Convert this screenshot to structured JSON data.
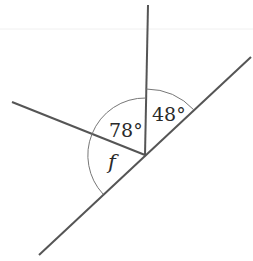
{
  "diagram": {
    "type": "angles-at-a-point-on-straight-line",
    "vertex": [
      145,
      155
    ],
    "rays": [
      {
        "name": "vertical-ray",
        "to": [
          148,
          5
        ]
      },
      {
        "name": "left-ray",
        "to": [
          12,
          102
        ]
      },
      {
        "name": "line-upper",
        "to": [
          251,
          57
        ]
      },
      {
        "name": "line-lower",
        "to": [
          39,
          255
        ]
      }
    ],
    "angles": [
      {
        "label": "48°",
        "between": [
          "vertical-ray",
          "line-upper"
        ]
      },
      {
        "label": "78°",
        "between": [
          "left-ray",
          "vertical-ray"
        ]
      },
      {
        "label": "f",
        "between": [
          "line-lower",
          "left-ray"
        ],
        "italic": true
      }
    ],
    "colors": {
      "line": "#555555",
      "arc": "#777777",
      "text": "#2a2a2a",
      "faint_rule": "#eeeeee"
    }
  }
}
